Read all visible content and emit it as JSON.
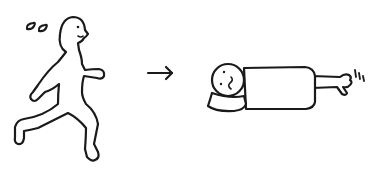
{
  "illustration": {
    "description": "Running person with sweat drops, arrow, then person lying face-down exhausted with twitching hand",
    "panels": [
      {
        "name": "running-person",
        "elements": [
          "sweat-drops",
          "head",
          "body",
          "arms",
          "legs"
        ]
      },
      {
        "name": "arrow",
        "direction": "right"
      },
      {
        "name": "collapsed-person",
        "elements": [
          "head",
          "pillow",
          "body",
          "arm",
          "twitching-hand",
          "twitch-marks"
        ]
      }
    ],
    "colors": {
      "ink": "#1a1a1a",
      "background": "#ffffff"
    }
  }
}
